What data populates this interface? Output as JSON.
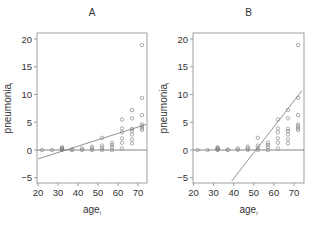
{
  "chart_data": [
    {
      "type": "scatter",
      "panel": "A",
      "title": "A",
      "xlabel": "age_i",
      "ylabel": "pneumonia_i",
      "xlim": [
        20,
        74
      ],
      "ylim": [
        -6,
        21
      ],
      "xticks": [
        20,
        30,
        40,
        50,
        60,
        70
      ],
      "yticks": [
        -5,
        0,
        5,
        10,
        15,
        20
      ],
      "grid": false,
      "points": [
        [
          22,
          0
        ],
        [
          27,
          0
        ],
        [
          32,
          0
        ],
        [
          32,
          0.1
        ],
        [
          32,
          0.2
        ],
        [
          32,
          0.3
        ],
        [
          32,
          0.5
        ],
        [
          37,
          0
        ],
        [
          37,
          0.1
        ],
        [
          42,
          0
        ],
        [
          42,
          0.3
        ],
        [
          47,
          0
        ],
        [
          47,
          0.3
        ],
        [
          47,
          0.6
        ],
        [
          52,
          0
        ],
        [
          52,
          0.4
        ],
        [
          52,
          0.8
        ],
        [
          52,
          2.2
        ],
        [
          57,
          0
        ],
        [
          57,
          0.5
        ],
        [
          57,
          0.9
        ],
        [
          57,
          1.3
        ],
        [
          62,
          0.3
        ],
        [
          62,
          1.3
        ],
        [
          62,
          2.1
        ],
        [
          62,
          3.2
        ],
        [
          62,
          3.9
        ],
        [
          62,
          5.5
        ],
        [
          67,
          1.2
        ],
        [
          67,
          1.9
        ],
        [
          67,
          2.8
        ],
        [
          67,
          3.4
        ],
        [
          67,
          3.8
        ],
        [
          67,
          5.7
        ],
        [
          67,
          7.2
        ],
        [
          72,
          3.6
        ],
        [
          72,
          3.9
        ],
        [
          72,
          4.3
        ],
        [
          72,
          4.6
        ],
        [
          72,
          6.3
        ],
        [
          72,
          9.4
        ],
        [
          72,
          18.9
        ]
      ],
      "fit_line": {
        "x": [
          20,
          74
        ],
        "y": [
          -1.6,
          4.6
        ]
      },
      "reference_line": {
        "y": 0
      }
    },
    {
      "type": "scatter",
      "panel": "B",
      "title": "B",
      "xlabel": "age_i",
      "ylabel": "pneumonia_i",
      "xlim": [
        20,
        74
      ],
      "ylim": [
        -6,
        21
      ],
      "xticks": [
        20,
        30,
        40,
        50,
        60,
        70
      ],
      "yticks": [
        -5,
        0,
        5,
        10,
        15,
        20
      ],
      "grid": false,
      "points": [
        [
          22,
          0
        ],
        [
          27,
          0
        ],
        [
          32,
          0
        ],
        [
          32,
          0.1
        ],
        [
          32,
          0.2
        ],
        [
          32,
          0.3
        ],
        [
          32,
          0.5
        ],
        [
          37,
          0
        ],
        [
          37,
          0.1
        ],
        [
          42,
          0
        ],
        [
          42,
          0.3
        ],
        [
          47,
          0
        ],
        [
          47,
          0.3
        ],
        [
          47,
          0.6
        ],
        [
          52,
          0
        ],
        [
          52,
          0.4
        ],
        [
          52,
          0.8
        ],
        [
          52,
          2.2
        ],
        [
          57,
          0
        ],
        [
          57,
          0.5
        ],
        [
          57,
          0.9
        ],
        [
          57,
          1.3
        ],
        [
          62,
          0.3
        ],
        [
          62,
          1.3
        ],
        [
          62,
          2.1
        ],
        [
          62,
          3.2
        ],
        [
          62,
          3.9
        ],
        [
          62,
          5.5
        ],
        [
          67,
          1.2
        ],
        [
          67,
          1.9
        ],
        [
          67,
          2.8
        ],
        [
          67,
          3.4
        ],
        [
          67,
          3.8
        ],
        [
          67,
          5.7
        ],
        [
          67,
          7.2
        ],
        [
          72,
          3.6
        ],
        [
          72,
          3.9
        ],
        [
          72,
          4.3
        ],
        [
          72,
          4.6
        ],
        [
          72,
          6.3
        ],
        [
          72,
          9.4
        ],
        [
          72,
          18.9
        ]
      ],
      "fit_line": {
        "x": [
          39,
          74
        ],
        "y": [
          -5.6,
          10.7
        ]
      },
      "reference_line": {
        "y": 0
      }
    }
  ]
}
